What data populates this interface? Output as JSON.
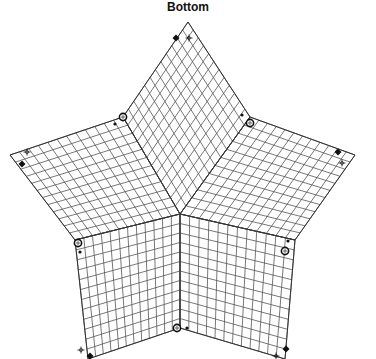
{
  "title": "Bottom",
  "colors": {
    "line": "#555555",
    "outline": "#333333",
    "marker": "#111111",
    "background": "#ffffff"
  },
  "grid_divisions": 12,
  "center": [
    180,
    214
  ],
  "vertices": {
    "top": [
      188,
      22
    ],
    "upper_left_inner": [
      123,
      117
    ],
    "left": [
      10,
      155
    ],
    "lower_left_inner": [
      75,
      240
    ],
    "bottom_left": [
      88,
      359
    ],
    "bottom_inner": [
      180,
      328
    ],
    "bottom_right": [
      285,
      359
    ],
    "lower_right_inner": [
      295,
      240
    ],
    "right": [
      355,
      155
    ],
    "upper_right_inner": [
      250,
      117
    ]
  },
  "faces": [
    {
      "name": "top-face",
      "corners": [
        "center",
        "upper_left_inner",
        "top",
        "upper_right_inner"
      ]
    },
    {
      "name": "left-face",
      "corners": [
        "center",
        "lower_left_inner",
        "left",
        "upper_left_inner"
      ]
    },
    {
      "name": "right-face",
      "corners": [
        "center",
        "upper_right_inner",
        "right",
        "lower_right_inner"
      ]
    },
    {
      "name": "bottom-left-face",
      "corners": [
        "center",
        "bottom_inner",
        "bottom_left",
        "lower_left_inner"
      ]
    },
    {
      "name": "bottom-right-face",
      "corners": [
        "center",
        "lower_right_inner",
        "bottom_right",
        "bottom_inner"
      ]
    }
  ],
  "markers": [
    {
      "type": "diamond",
      "x": 176,
      "y": 38
    },
    {
      "type": "cross",
      "x": 189,
      "y": 38
    },
    {
      "type": "ring",
      "x": 123,
      "y": 117
    },
    {
      "type": "dot",
      "x": 115,
      "y": 124
    },
    {
      "type": "ring",
      "x": 250,
      "y": 123
    },
    {
      "type": "dot",
      "x": 242,
      "y": 115
    },
    {
      "type": "cross",
      "x": 27,
      "y": 152
    },
    {
      "type": "diamond",
      "x": 22,
      "y": 164
    },
    {
      "type": "diamond",
      "x": 338,
      "y": 152
    },
    {
      "type": "cross",
      "x": 342,
      "y": 163
    },
    {
      "type": "ring",
      "x": 78,
      "y": 243
    },
    {
      "type": "dot",
      "x": 80,
      "y": 252
    },
    {
      "type": "dot",
      "x": 288,
      "y": 241
    },
    {
      "type": "ring",
      "x": 285,
      "y": 251
    },
    {
      "type": "cross",
      "x": 81,
      "y": 350
    },
    {
      "type": "diamond",
      "x": 90,
      "y": 356
    },
    {
      "type": "ring",
      "x": 177,
      "y": 328
    },
    {
      "type": "dot",
      "x": 187,
      "y": 328
    },
    {
      "type": "diamond",
      "x": 286,
      "y": 349
    },
    {
      "type": "cross",
      "x": 276,
      "y": 356
    }
  ]
}
